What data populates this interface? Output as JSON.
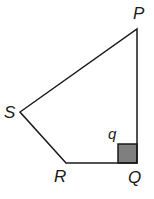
{
  "diagram": {
    "type": "quadrilateral",
    "vertices": {
      "P": {
        "label": "P",
        "x": 137,
        "y": 29
      },
      "Q": {
        "label": "Q",
        "x": 137,
        "y": 163
      },
      "R": {
        "label": "R",
        "x": 66,
        "y": 163
      },
      "S": {
        "label": "S",
        "x": 20,
        "y": 112
      }
    },
    "angle_marker": {
      "label": "q",
      "at": "Q",
      "type": "right-angle",
      "fill": "#7f7f7f",
      "stroke": "#1a1a1a"
    },
    "colors": {
      "line": "#1a1a1a",
      "background": "#ffffff"
    }
  }
}
